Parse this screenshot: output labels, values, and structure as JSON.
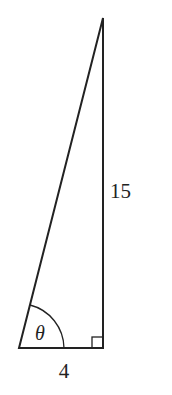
{
  "diagram": {
    "type": "right-triangle",
    "labels": {
      "vertical_side": "15",
      "horizontal_side": "4",
      "angle": "θ"
    },
    "stroke_color": "#222222",
    "background": "#ffffff"
  }
}
